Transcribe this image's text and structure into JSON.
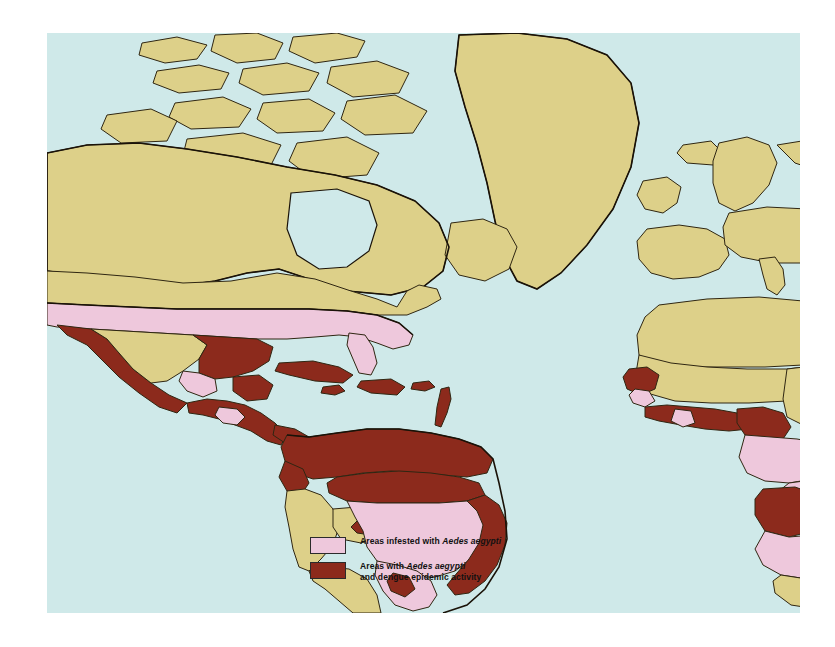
{
  "figure": {
    "kind": "world-distribution-map",
    "title_visible": false,
    "colors": {
      "ocean": "#cfe9e9",
      "land_default": "#ddd089",
      "infested_pink": "#eec8dc",
      "epidemic_red": "#8c2a1c",
      "border": "#3a2d16",
      "coastline": "#1a1208",
      "page_background": "#ffffff"
    }
  },
  "legend": {
    "items": [
      {
        "swatch_color": "#eec8dc",
        "swatch_name": "pink-swatch",
        "text_lines": [
          "Areas infested with "
        ],
        "species": "Aedes aegypti",
        "tail": "",
        "full_text": "Areas infested with Aedes aegypti"
      },
      {
        "swatch_color": "#8c2a1c",
        "swatch_name": "red-swatch",
        "text_lines": [
          "Areas with "
        ],
        "species": "Aedes aegypti",
        "tail": "and dengue epidemic activity",
        "full_text": "Areas with Aedes aegypti and dengue epidemic activity"
      }
    ]
  },
  "regions": {
    "epidemic_red": [
      "Mexico (coastal)",
      "Guatemala",
      "Belize",
      "Honduras",
      "El Salvador",
      "Nicaragua",
      "Costa Rica",
      "Panama",
      "Cuba",
      "Hispaniola",
      "Jamaica",
      "Puerto Rico",
      "Lesser Antilles",
      "Colombia",
      "Venezuela",
      "Guyana",
      "Suriname",
      "French Guiana",
      "Ecuador",
      "northern Brazil",
      "eastern Brazil coast",
      "Senegal",
      "Guinea",
      "Sierra Leone",
      "Liberia",
      "Ivory Coast",
      "Ghana",
      "Togo",
      "Benin",
      "Nigeria",
      "Cameroon",
      "Saudi Arabia",
      "Somalia",
      "Kenya",
      "Angola",
      "Mozambique",
      "South Africa (northeast)",
      "Pakistan",
      "India",
      "Sri Lanka",
      "Bangladesh",
      "Myanmar",
      "Thailand",
      "Laos",
      "Cambodia",
      "Vietnam",
      "Malaysia",
      "Indonesia",
      "Philippines",
      "Papua New Guinea",
      "Queensland, Australia",
      "southern China",
      "Taiwan"
    ],
    "infested_pink": [
      "southern United States",
      "southern Mexico (interior)",
      "Honduras interior",
      "central Brazil",
      "Paraguay",
      "northern Argentina",
      "Bolivia (east)",
      "Guinea-Bissau",
      "Gabon",
      "Congo",
      "DR Congo",
      "Central African Republic",
      "South Sudan",
      "Uganda",
      "Tanzania",
      "Zambia",
      "Zimbabwe",
      "Botswana",
      "Namibia",
      "Malawi",
      "Madagascar"
    ],
    "land_default": [
      "Canada",
      "Greenland",
      "northern United States",
      "Europe",
      "Russia",
      "North Africa",
      "Sahara",
      "Sahel",
      "Chad",
      "Niger",
      "Mali",
      "Sudan",
      "Ethiopia",
      "Peru",
      "Chile",
      "Argentina (south)",
      "China",
      "Mongolia",
      "Japan",
      "Korea",
      "Iran",
      "Turkey",
      "Kazakhstan",
      "Australia (west and south)",
      "South Africa (south)"
    ]
  }
}
